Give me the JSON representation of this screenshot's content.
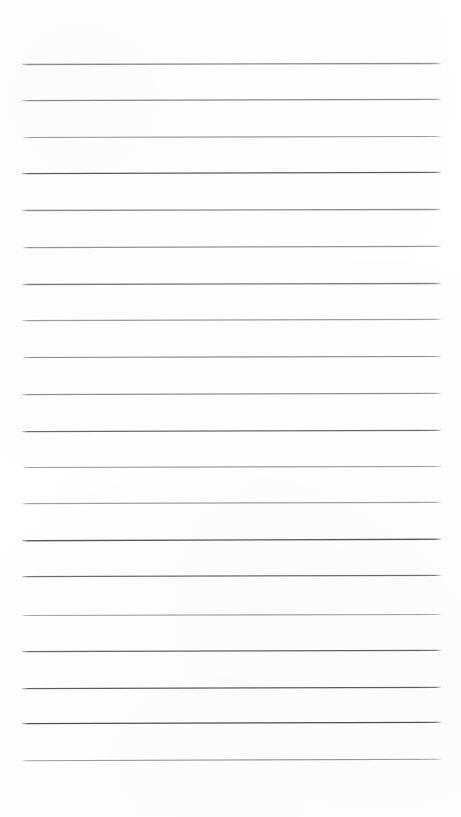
{
  "page": {
    "kind": "lined-paper-scan",
    "width": 461,
    "height": 817,
    "background_color": "#ffffff",
    "content_text": "",
    "line_count": 20
  },
  "ruling": {
    "first_line_y": 64,
    "line_spacing": 36.6,
    "left_x": 22,
    "right_x": 441,
    "line_thickness": 1.2,
    "orientation": "horizontal",
    "default_color": "#6f6f6f"
  },
  "lines": [
    {
      "index": 1,
      "y": 64,
      "x_start": 22,
      "x_end": 441,
      "color": "#8e8e8e",
      "thickness": 1.3,
      "slant": -1.0
    },
    {
      "index": 2,
      "y": 100,
      "x_start": 22,
      "x_end": 441,
      "color": "#8a8a8a",
      "thickness": 1.3,
      "slant": -1.2
    },
    {
      "index": 3,
      "y": 137,
      "x_start": 23,
      "x_end": 441,
      "color": "#9a9a9a",
      "thickness": 1.2,
      "slant": -1.0
    },
    {
      "index": 4,
      "y": 173,
      "x_start": 22,
      "x_end": 441,
      "color": "#5c5c5c",
      "thickness": 1.2,
      "slant": -1.4
    },
    {
      "index": 5,
      "y": 210,
      "x_start": 22,
      "x_end": 441,
      "color": "#8f8f8f",
      "thickness": 1.3,
      "slant": -1.0
    },
    {
      "index": 6,
      "y": 247,
      "x_start": 23,
      "x_end": 441,
      "color": "#949494",
      "thickness": 1.2,
      "slant": -1.2
    },
    {
      "index": 7,
      "y": 284,
      "x_start": 22,
      "x_end": 441,
      "color": "#7d7d7d",
      "thickness": 1.3,
      "slant": -1.0
    },
    {
      "index": 8,
      "y": 320,
      "x_start": 22,
      "x_end": 441,
      "color": "#9c9c9c",
      "thickness": 1.2,
      "slant": -1.3
    },
    {
      "index": 9,
      "y": 357,
      "x_start": 23,
      "x_end": 441,
      "color": "#8b8b8b",
      "thickness": 1.2,
      "slant": -1.0
    },
    {
      "index": 10,
      "y": 394,
      "x_start": 22,
      "x_end": 441,
      "color": "#909090",
      "thickness": 1.2,
      "slant": -1.1
    },
    {
      "index": 11,
      "y": 431,
      "x_start": 22,
      "x_end": 441,
      "color": "#6a6a6a",
      "thickness": 1.3,
      "slant": -1.4
    },
    {
      "index": 12,
      "y": 467,
      "x_start": 23,
      "x_end": 441,
      "color": "#9b9b9b",
      "thickness": 1.2,
      "slant": -1.0
    },
    {
      "index": 13,
      "y": 503,
      "x_start": 22,
      "x_end": 441,
      "color": "#a0a0a0",
      "thickness": 1.2,
      "slant": -1.2
    },
    {
      "index": 14,
      "y": 540,
      "x_start": 22,
      "x_end": 441,
      "color": "#5a5a5a",
      "thickness": 1.3,
      "slant": -1.5
    },
    {
      "index": 15,
      "y": 576,
      "x_start": 22,
      "x_end": 441,
      "color": "#6e6e6e",
      "thickness": 1.3,
      "slant": -1.2
    },
    {
      "index": 16,
      "y": 615,
      "x_start": 22,
      "x_end": 441,
      "color": "#a2a2a2",
      "thickness": 1.2,
      "slant": -1.0
    },
    {
      "index": 17,
      "y": 651,
      "x_start": 22,
      "x_end": 441,
      "color": "#646464",
      "thickness": 1.3,
      "slant": -1.3
    },
    {
      "index": 18,
      "y": 688,
      "x_start": 22,
      "x_end": 441,
      "color": "#5e5e5e",
      "thickness": 1.3,
      "slant": -1.2
    },
    {
      "index": 19,
      "y": 723,
      "x_start": 22,
      "x_end": 441,
      "color": "#4f4f4f",
      "thickness": 1.3,
      "slant": -1.4
    },
    {
      "index": 20,
      "y": 760,
      "x_start": 22,
      "x_end": 441,
      "color": "#9d9d9d",
      "thickness": 1.2,
      "slant": -1.5
    }
  ]
}
